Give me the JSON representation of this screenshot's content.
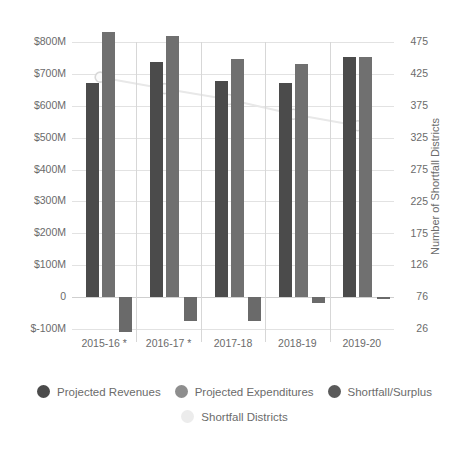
{
  "chart_data": {
    "type": "bar",
    "title": "",
    "xlabel": "",
    "ylabel": "",
    "y2label": "Number of Shortfall Districts",
    "grid": true,
    "legend_position": "bottom",
    "categories": [
      "2015-16 *",
      "2016-17 *",
      "2017-18",
      "2018-19",
      "2019-20"
    ],
    "left_axis": {
      "ticks": [
        "$800M",
        "$700M",
        "$600M",
        "$500M",
        "$400M",
        "$300M",
        "$200M",
        "$100M",
        "0",
        "$-100M"
      ],
      "tick_values": [
        800,
        700,
        600,
        500,
        400,
        300,
        200,
        100,
        0,
        -100
      ],
      "ylim": [
        -100,
        800
      ],
      "units": "millions of dollars"
    },
    "right_axis": {
      "ticks": [
        "475",
        "425",
        "375",
        "325",
        "275",
        "225",
        "175",
        "126",
        "76",
        "26"
      ],
      "tick_values": [
        475,
        425,
        375,
        325,
        275,
        225,
        175,
        126,
        76,
        26
      ],
      "ylim": [
        26,
        475
      ]
    },
    "series": [
      {
        "name": "Projected Revenues",
        "type": "bar",
        "axis": "left",
        "color": "#4b4b4b",
        "values": [
          672,
          737,
          677,
          672,
          752
        ]
      },
      {
        "name": "Projected Expenditures",
        "type": "bar",
        "axis": "left",
        "color": "#707070",
        "values": [
          832,
          818,
          748,
          730,
          752
        ]
      },
      {
        "name": "Shortfall/Surplus",
        "type": "bar",
        "axis": "left",
        "color": "#6a6a6a",
        "values": [
          -108,
          -75,
          -75,
          -18,
          -3
        ]
      },
      {
        "name": "Shortfall Districts",
        "type": "line",
        "axis": "right",
        "color": "#efefef",
        "marker": "circle",
        "values": [
          420,
          402,
          385,
          362,
          344
        ]
      }
    ]
  },
  "legend": {
    "rows": [
      [
        {
          "label": "Projected Revenues",
          "color": "#4b4b4b"
        },
        {
          "label": "Projected Expenditures",
          "color": "#8e8e8e"
        },
        {
          "label": "Shortfall/Surplus",
          "color": "#5a5a5a"
        }
      ],
      [
        {
          "label": "Shortfall Districts",
          "color": "#ececec"
        }
      ]
    ]
  }
}
